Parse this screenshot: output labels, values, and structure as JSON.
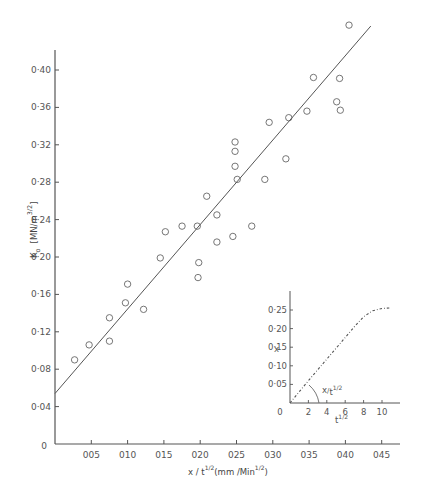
{
  "chart_data": [
    {
      "type": "scatter",
      "title": "",
      "xlabel": "x / t^1/2 (mm / Min^1/2)",
      "ylabel": "K_o (MN / m^3/2)",
      "xlim": [
        0,
        0.47
      ],
      "ylim": [
        0,
        0.46
      ],
      "xticks": [
        0.05,
        0.1,
        0.15,
        0.2,
        0.25,
        0.3,
        0.35,
        0.4,
        0.45
      ],
      "xtick_labels": [
        "005",
        "010",
        "015",
        "020",
        "025",
        "030",
        "035",
        "040",
        "045"
      ],
      "yticks": [
        0.04,
        0.08,
        0.12,
        0.16,
        0.2,
        0.24,
        0.28,
        0.32,
        0.36,
        0.4
      ],
      "ytick_labels": [
        "0·04",
        "0·08",
        "0·12",
        "0·16",
        "0·20",
        "0·24",
        "0·28",
        "0·32",
        "0·36",
        "0·40"
      ],
      "origin_label": "0",
      "grid": false,
      "marker": "open-circle",
      "series": [
        {
          "name": "measured",
          "points": [
            [
              0.027,
              0.09
            ],
            [
              0.047,
              0.106
            ],
            [
              0.075,
              0.11
            ],
            [
              0.075,
              0.135
            ],
            [
              0.097,
              0.151
            ],
            [
              0.1,
              0.171
            ],
            [
              0.122,
              0.144
            ],
            [
              0.145,
              0.199
            ],
            [
              0.152,
              0.227
            ],
            [
              0.175,
              0.233
            ],
            [
              0.196,
              0.233
            ],
            [
              0.198,
              0.194
            ],
            [
              0.197,
              0.178
            ],
            [
              0.209,
              0.265
            ],
            [
              0.223,
              0.245
            ],
            [
              0.223,
              0.216
            ],
            [
              0.245,
              0.222
            ],
            [
              0.248,
              0.323
            ],
            [
              0.248,
              0.313
            ],
            [
              0.248,
              0.297
            ],
            [
              0.251,
              0.283
            ],
            [
              0.271,
              0.233
            ],
            [
              0.289,
              0.283
            ],
            [
              0.295,
              0.344
            ],
            [
              0.318,
              0.305
            ],
            [
              0.322,
              0.349
            ],
            [
              0.347,
              0.356
            ],
            [
              0.356,
              0.392
            ],
            [
              0.388,
              0.366
            ],
            [
              0.393,
              0.357
            ],
            [
              0.392,
              0.391
            ],
            [
              0.405,
              0.448
            ]
          ]
        },
        {
          "name": "fit-line",
          "type": "line",
          "points": [
            [
              0.0,
              0.054
            ],
            [
              0.435,
              0.447
            ]
          ]
        }
      ]
    },
    {
      "type": "line",
      "title": "inset",
      "xlabel": "t^1/2",
      "ylabel": "x",
      "xlim": [
        0,
        12
      ],
      "ylim": [
        0,
        0.28
      ],
      "xticks": [
        2,
        4,
        6,
        8,
        10
      ],
      "xtick_labels": [
        "2",
        "4",
        "6",
        "8",
        "10"
      ],
      "yticks": [
        0.05,
        0.1,
        0.15,
        0.2,
        0.25
      ],
      "ytick_labels": [
        "0·05",
        "0·10",
        "0·15",
        "0·20",
        "0·25"
      ],
      "origin_label": "0",
      "annotation": "x/t^1/2",
      "line_style": "dash-dot",
      "series": [
        {
          "name": "x vs t^1/2",
          "points": [
            [
              0,
              0
            ],
            [
              1,
              0.03
            ],
            [
              2,
              0.06
            ],
            [
              3,
              0.089
            ],
            [
              4,
              0.118
            ],
            [
              5,
              0.147
            ],
            [
              6,
              0.176
            ],
            [
              7,
              0.205
            ],
            [
              8,
              0.232
            ],
            [
              9,
              0.248
            ],
            [
              10,
              0.254
            ],
            [
              11,
              0.256
            ]
          ]
        }
      ]
    }
  ],
  "labels": {
    "main_ylabel_main": "K",
    "main_ylabel_sub": "o",
    "main_ylabel_units": "[MN/m",
    "main_ylabel_exp": "3/2",
    "main_ylabel_close": "]",
    "main_xlabel_base": "x / t",
    "main_xlabel_exp": "1/2",
    "main_xlabel_units": "(mm /Min",
    "main_xlabel_units_exp": "1/2",
    "main_xlabel_close": ")",
    "inset_ylabel": "x",
    "inset_xlabel_base": "t",
    "inset_xlabel_exp": "1/2",
    "inset_annotation_base": "x",
    "inset_annotation_den": "t",
    "inset_annotation_exp": "1/2"
  },
  "colors": {
    "axis": "#555555",
    "marker": "#666666",
    "line": "#555555",
    "text": "#555555",
    "background": "#ffffff"
  }
}
